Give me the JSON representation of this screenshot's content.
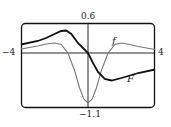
{
  "chart_data": {
    "type": "line",
    "title": "",
    "xlabel": "",
    "ylabel": "",
    "xlim": [
      -4,
      4
    ],
    "ylim": [
      -1.1,
      0.6
    ],
    "grid": false,
    "legend": "inline labels",
    "tick_labels": {
      "x_left": "-4",
      "x_right": "4",
      "y_top": "0.6",
      "y_bottom": "-1.1"
    },
    "series": [
      {
        "name": "f",
        "style": "thin gray",
        "x": [
          -4,
          -3,
          -2.5,
          -2,
          -1.6,
          -1.2,
          -0.8,
          -0.5,
          -0.25,
          0,
          0.25,
          0.5,
          0.8,
          1.2,
          1.6,
          2,
          2.5,
          3,
          4
        ],
        "y": [
          0.08,
          0.14,
          0.18,
          0.2,
          0.17,
          0.0,
          -0.35,
          -0.7,
          -0.92,
          -1.0,
          -0.92,
          -0.7,
          -0.35,
          0.0,
          0.17,
          0.2,
          0.17,
          0.13,
          0.07
        ]
      },
      {
        "name": "F",
        "style": "thick black",
        "x": [
          -4,
          -3,
          -2.5,
          -2,
          -1.6,
          -1.3,
          -1.0,
          -0.6,
          -0.3,
          0,
          0.3,
          0.6,
          1.0,
          1.4,
          2,
          2.5,
          3,
          4
        ],
        "y": [
          0.17,
          0.24,
          0.3,
          0.38,
          0.44,
          0.45,
          0.38,
          0.2,
          0.1,
          0.0,
          -0.2,
          -0.38,
          -0.52,
          -0.55,
          -0.5,
          -0.45,
          -0.4,
          -0.33
        ]
      }
    ],
    "annotations": [
      {
        "text": "f",
        "x": 1.8,
        "y": 0.35
      },
      {
        "text": "F",
        "x": 2.8,
        "y": -0.65
      }
    ]
  },
  "labels": {
    "y_top": "0.6",
    "y_bottom": "−1.1",
    "x_left": "−4",
    "x_right": "4",
    "f": "f",
    "F": "F"
  }
}
